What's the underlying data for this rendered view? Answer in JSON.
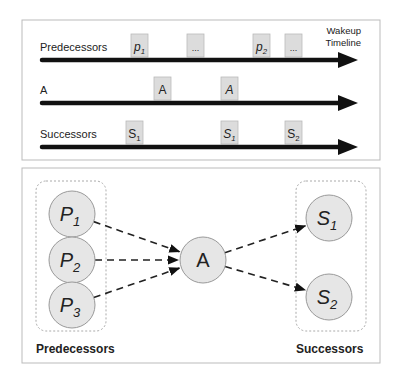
{
  "timeline_panel": {
    "axis_label": [
      "Wakeup",
      "Timeline"
    ],
    "rows": [
      {
        "label": "Predecessors",
        "events": [
          {
            "text": "p",
            "sub": "1",
            "italic": true,
            "x": 131
          },
          {
            "text": "...",
            "sub": "",
            "italic": false,
            "x": 187
          },
          {
            "text": "p",
            "sub": "2",
            "italic": true,
            "x": 253
          },
          {
            "text": "...",
            "sub": "",
            "italic": false,
            "x": 285
          }
        ]
      },
      {
        "label": "A",
        "events": [
          {
            "text": "A",
            "sub": "",
            "italic": false,
            "x": 154
          },
          {
            "text": "A",
            "sub": "",
            "italic": true,
            "x": 221
          }
        ]
      },
      {
        "label": "Successors",
        "events": [
          {
            "text": "S",
            "sub": "1",
            "italic": false,
            "x": 126
          },
          {
            "text": "S",
            "sub": "1",
            "italic": true,
            "x": 221
          },
          {
            "text": "S",
            "sub": "2",
            "italic": false,
            "x": 285
          }
        ]
      }
    ]
  },
  "graph_panel": {
    "predecessors_group_label": "Predecessors",
    "successors_group_label": "Successors",
    "predecessor_nodes": [
      {
        "text": "P",
        "sub": "1"
      },
      {
        "text": "P",
        "sub": "2"
      },
      {
        "text": "P",
        "sub": "3"
      }
    ],
    "center_node": {
      "text": "A"
    },
    "successor_nodes": [
      {
        "text": "S",
        "sub": "1"
      },
      {
        "text": "S",
        "sub": "2"
      }
    ]
  },
  "colors": {
    "node_fill": "#e6e6e6",
    "node_stroke": "#999999",
    "event_fill": "#dcdcdc",
    "arrow": "#111111",
    "panel_border": "#bbbbbb"
  }
}
